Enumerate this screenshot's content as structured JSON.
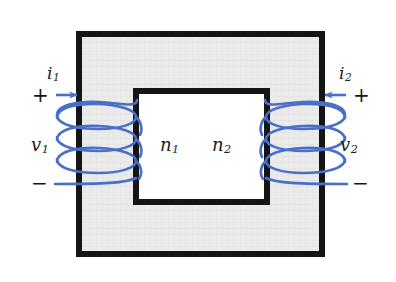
{
  "figure": {
    "type": "circuit-diagram",
    "width": 396,
    "height": 282,
    "background_color": "#ffffff"
  },
  "core": {
    "name": "magnetic-core",
    "fill_color": "#ebebeb",
    "stroke_color": "#151515",
    "outer": {
      "x": 76,
      "y": 31,
      "width": 249,
      "height": 226,
      "stroke_width": 6
    },
    "window": {
      "x": 133,
      "y": 88,
      "width": 137,
      "height": 117,
      "stroke_width": 6,
      "fill_color": "#ffffff"
    }
  },
  "wire": {
    "color": "#4a6fc8",
    "stroke_width": 2.6
  },
  "labels": {
    "current_left": "i",
    "current_left_sub": "1",
    "current_right": "i",
    "current_right_sub": "2",
    "voltage_left": "v",
    "voltage_left_sub": "1",
    "voltage_right": "v",
    "voltage_right_sub": "2",
    "turns_left": "n",
    "turns_left_sub": "1",
    "turns_right": "n",
    "turns_right_sub": "2",
    "plus_left": "+",
    "minus_left": "−",
    "plus_right": "+",
    "minus_right": "−"
  },
  "windings": {
    "primary": {
      "name": "primary-winding",
      "turns_shown": 3,
      "side": "left"
    },
    "secondary": {
      "name": "secondary-winding",
      "turns_shown": 3,
      "side": "right"
    }
  }
}
